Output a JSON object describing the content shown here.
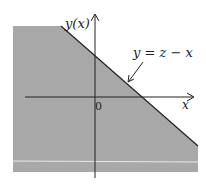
{
  "diagram": {
    "y_axis_label": "y(x)",
    "x_axis_label": "x",
    "origin_label": "0",
    "line_label": "y = z − x",
    "colors": {
      "region_fill": "#a8a8a8",
      "axis": "#222222",
      "line": "#222222",
      "background": "#ffffff"
    }
  }
}
